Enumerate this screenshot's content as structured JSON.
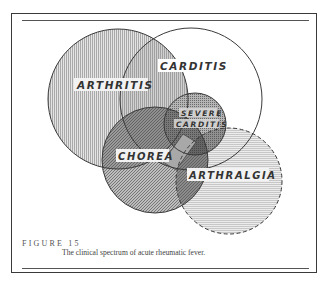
{
  "figure": {
    "number_label": "FIGURE 15",
    "caption": "The clinical spectrum of acute rheumatic fever."
  },
  "diagram": {
    "type": "venn",
    "sets": [
      {
        "id": "arthritis",
        "label": "ARTHRITIS",
        "cx": 118,
        "cy": 99,
        "r": 70,
        "border": "solid",
        "fill_pattern": "vertical-lines"
      },
      {
        "id": "carditis",
        "label": "CARDITIS",
        "cx": 191,
        "cy": 99,
        "r": 71,
        "border": "solid",
        "fill_pattern": "none"
      },
      {
        "id": "severe-carditis",
        "label_line1": "SEVERE",
        "label_line2": "CARDITIS",
        "cx": 195,
        "cy": 124,
        "r": 31,
        "border": "solid",
        "fill_pattern": "fine-stipple"
      },
      {
        "id": "chorea",
        "label": "CHOREA",
        "cx": 155,
        "cy": 160,
        "r": 53,
        "border": "solid",
        "fill_pattern": "diagonal-hatch"
      },
      {
        "id": "arthralgia",
        "label": "ARTHRALGIA",
        "cx": 229,
        "cy": 181,
        "r": 53,
        "border": "dashed",
        "fill_pattern": "horizontal-lines"
      }
    ],
    "colors": {
      "stroke": "#3a3a3a",
      "arthritis_fill": "#c9c9c9",
      "severe_fill": "#9a9a9a",
      "chorea_fill": "#8f8f8f",
      "arthralgia_fill": "#d6d6d6",
      "label_bg": "#f2f2f2"
    }
  }
}
